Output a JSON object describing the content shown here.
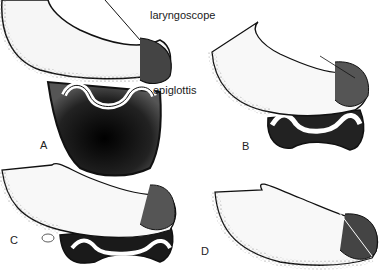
{
  "figure": {
    "labels": {
      "laryngoscope": "laryngoscope",
      "epiglottis": "epiglottis"
    },
    "panels": [
      {
        "letter": "A"
      },
      {
        "letter": "B"
      },
      {
        "letter": "C"
      },
      {
        "letter": "D"
      }
    ],
    "colors": {
      "ink": "#111111",
      "paper": "#ffffff",
      "shade": "#555555"
    }
  }
}
